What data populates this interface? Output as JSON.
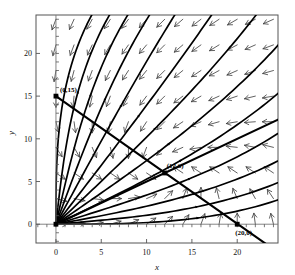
{
  "figure": {
    "kind": "phase-portrait",
    "background": "#ffffff",
    "ink": "#000000"
  },
  "axes": {
    "xlabel": "x",
    "ylabel": "y",
    "xticks": [
      "0",
      "5",
      "10",
      "15",
      "20"
    ],
    "yticks": [
      "0",
      "5",
      "10",
      "15",
      "20"
    ],
    "xtick_values": [
      0,
      5,
      10,
      15,
      20
    ],
    "ytick_values": [
      0,
      5,
      10,
      15,
      20
    ],
    "xlim": [
      -2.2,
      24.5
    ],
    "ylim": [
      -2.2,
      24.5
    ],
    "frame": true,
    "grid": false
  },
  "annotations": [
    {
      "id": "pt-0-15",
      "label": "(0,15)",
      "x": 0,
      "y": 15,
      "marker": "filled-square"
    },
    {
      "id": "pt-12-6",
      "label": "(12,6)",
      "x": 12,
      "y": 6,
      "marker": "filled-square"
    },
    {
      "id": "pt-20-0",
      "label": "(20,0)",
      "x": 20,
      "y": 0,
      "marker": "filled-square"
    },
    {
      "id": "pt-0-0",
      "label": "",
      "x": 0,
      "y": 0,
      "marker": "filled-square"
    }
  ],
  "chart_data": {
    "type": "scatter",
    "title": "",
    "xlabel": "x",
    "ylabel": "y",
    "xlim": [
      -2.2,
      24.5
    ],
    "ylim": [
      -2.2,
      24.5
    ],
    "grid": false,
    "legend": "none",
    "nullclines": [
      {
        "name": "nullcline-A",
        "from": [
          0,
          15
        ],
        "to": [
          24.5,
          -3.3
        ],
        "through": [
          12,
          6
        ],
        "slope": -0.75
      },
      {
        "name": "nullcline-B",
        "from": [
          0,
          0
        ],
        "to": [
          24.5,
          12.25
        ],
        "through": [
          12,
          6
        ],
        "slope": 0.5
      }
    ],
    "equilibria": [
      [
        0,
        0
      ],
      [
        0,
        15
      ],
      [
        12,
        6
      ],
      [
        20,
        0
      ]
    ],
    "trajectory_fan_origin": [
      0,
      0
    ],
    "trajectory_exit_angles_deg": [
      90,
      84,
      78,
      71,
      63,
      54,
      45,
      36,
      27,
      18,
      11,
      5,
      0
    ],
    "vector_field": {
      "arrow_grid_x": [
        0,
        2,
        4,
        6,
        8,
        10,
        12,
        14,
        16,
        18,
        20,
        22,
        24
      ],
      "arrow_grid_y": [
        0,
        3,
        6,
        9,
        12,
        15,
        18,
        21,
        24
      ],
      "description": "arrows point down in upper-left, down-left in upper-right, left in lower-right, up-right inside the wedge between the two nullclines, right along the lower band"
    }
  }
}
